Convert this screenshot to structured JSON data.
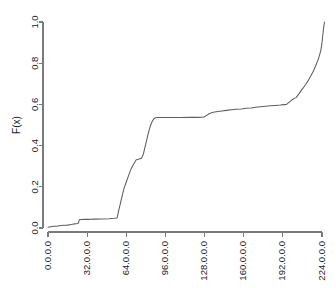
{
  "chart_data": {
    "type": "line",
    "title": "",
    "subtitle": "",
    "xlabel": "",
    "ylabel": "F(x)",
    "grid": false,
    "legend": null,
    "xlim": [
      0,
      256
    ],
    "ylim": [
      0.0,
      1.0
    ],
    "xtick_labels": [
      "0.0.0.0",
      "32.0.0.0",
      "64.0.0.0",
      "96.0.0.0",
      "128.0.0.0",
      "160.0.0.0",
      "192.0.0.0",
      "224.0.0.0"
    ],
    "xtick_values": [
      0,
      32,
      64,
      96,
      128,
      160,
      192,
      224
    ],
    "ytick_labels": [
      "0.0",
      "0.2",
      "0.4",
      "0.6",
      "0.8",
      "1.0"
    ],
    "ytick_values": [
      0.0,
      0.2,
      0.4,
      0.6,
      0.8,
      1.0
    ],
    "series": [
      {
        "name": "ECDF",
        "color": "#5e5e5e",
        "x": [
          0.0,
          2.0,
          4.5,
          7.0,
          9.0,
          11.0,
          13.0,
          16.0,
          18.0,
          20.0,
          22.0,
          24.0,
          25.0,
          25.5,
          27.0,
          30.0,
          34.0,
          38.0,
          44.0,
          50.0,
          54.0,
          56.5,
          57.0,
          58.0,
          59.0,
          60.0,
          61.0,
          62.0,
          63.5,
          65.0,
          66.5,
          68.0,
          69.5,
          71.0,
          72.0,
          73.0,
          74.0,
          75.0,
          76.5,
          78.0,
          79.0,
          80.0,
          81.0,
          82.0,
          83.0,
          84.0,
          85.0,
          86.0,
          87.0,
          88.0,
          90.0,
          94.0,
          100.0,
          108.0,
          116.0,
          122.0,
          126.0,
          128.0,
          130.0,
          132.0,
          134.0,
          136.0,
          139.0,
          142.0,
          146.0,
          150.0,
          154.0,
          158.0,
          162.0,
          166.0,
          170.0,
          174.0,
          178.0,
          182.0,
          186.0,
          190.0,
          193.0,
          195.0,
          197.0,
          199.0,
          201.0,
          203.0,
          205.0,
          207.0,
          209.0,
          211.0,
          213.0,
          215.0,
          217.0,
          219.0,
          221.0,
          223.0,
          224.0,
          225.0,
          226.0
        ],
        "y": [
          0.004,
          0.006,
          0.008,
          0.009,
          0.011,
          0.012,
          0.013,
          0.014,
          0.016,
          0.018,
          0.02,
          0.022,
          0.024,
          0.04,
          0.041,
          0.042,
          0.042,
          0.043,
          0.044,
          0.045,
          0.047,
          0.049,
          0.062,
          0.09,
          0.115,
          0.14,
          0.165,
          0.19,
          0.215,
          0.24,
          0.265,
          0.288,
          0.305,
          0.32,
          0.33,
          0.333,
          0.334,
          0.336,
          0.338,
          0.36,
          0.385,
          0.41,
          0.435,
          0.46,
          0.482,
          0.5,
          0.515,
          0.526,
          0.532,
          0.535,
          0.536,
          0.536,
          0.536,
          0.536,
          0.537,
          0.537,
          0.538,
          0.54,
          0.548,
          0.556,
          0.56,
          0.563,
          0.566,
          0.568,
          0.571,
          0.574,
          0.576,
          0.578,
          0.581,
          0.583,
          0.586,
          0.589,
          0.591,
          0.593,
          0.595,
          0.597,
          0.599,
          0.6,
          0.61,
          0.62,
          0.628,
          0.634,
          0.65,
          0.668,
          0.683,
          0.7,
          0.718,
          0.74,
          0.762,
          0.79,
          0.82,
          0.86,
          0.9,
          0.955,
          1.0
        ]
      }
    ]
  },
  "colors": {
    "line": "#5e5e5e",
    "axis": "#7a7a7a",
    "text": "#1a1a1a",
    "background": "#ffffff"
  }
}
